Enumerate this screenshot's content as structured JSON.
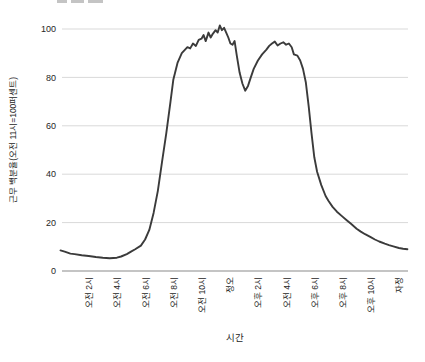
{
  "page": {
    "background": "#ffffff"
  },
  "chart_data": {
    "type": "line",
    "title": "",
    "xlabel": "시간",
    "ylabel": "근무 백분율(오전 11시=100퍼센트)",
    "x_tick_labels": [
      "오전 2시",
      "오전 4시",
      "오전 6시",
      "오전 8시",
      "오전 10시",
      "정오",
      "오후 2시",
      "오전 4시",
      "오후 6시",
      "오후 8시",
      "오후 10시",
      "자정"
    ],
    "x_tick_hours": [
      2,
      4,
      6,
      8,
      10,
      12,
      14,
      16,
      18,
      20,
      22,
      24
    ],
    "y_ticks": [
      0,
      20,
      40,
      60,
      80,
      100
    ],
    "xlim": [
      0,
      24.6
    ],
    "ylim": [
      0,
      102
    ],
    "grid": true,
    "legend": "none",
    "line_color": "#3b3b3b",
    "grid_color": "#d9d9d9",
    "axis_color": "#8a8a8a",
    "text_color": "#262626",
    "series": [
      {
        "name": "근무 백분율",
        "x": [
          0,
          0.3,
          0.7,
          1,
          1.5,
          2,
          2.5,
          3,
          3.5,
          4,
          4.3,
          4.7,
          5,
          5.3,
          5.7,
          6,
          6.3,
          6.6,
          6.9,
          7.2,
          7.5,
          7.8,
          8,
          8.3,
          8.6,
          9,
          9.2,
          9.4,
          9.6,
          9.8,
          10,
          10.15,
          10.3,
          10.5,
          10.65,
          10.8,
          11,
          11.15,
          11.3,
          11.45,
          11.6,
          11.75,
          11.9,
          12.05,
          12.2,
          12.35,
          12.5,
          12.7,
          12.9,
          13.1,
          13.3,
          13.5,
          13.7,
          14,
          14.3,
          14.6,
          14.8,
          15,
          15.2,
          15.4,
          15.6,
          15.8,
          16,
          16.2,
          16.4,
          16.55,
          16.8,
          17,
          17.2,
          17.4,
          17.6,
          17.8,
          18,
          18.2,
          18.5,
          18.8,
          19,
          19.3,
          19.6,
          20,
          20.3,
          20.6,
          21,
          21.3,
          21.6,
          22,
          22.3,
          22.6,
          23,
          23.3,
          23.6,
          24,
          24.3,
          24.6
        ],
        "y": [
          8.5,
          8,
          7.2,
          7,
          6.5,
          6.2,
          5.8,
          5.5,
          5.3,
          5.5,
          6,
          7,
          8,
          9,
          10.5,
          13,
          17,
          24,
          33,
          45,
          57,
          70,
          79,
          86,
          90,
          92.5,
          92,
          94,
          93,
          95.5,
          96,
          97.5,
          95,
          98.5,
          96.5,
          98,
          99.5,
          98.5,
          101.5,
          99.5,
          100.5,
          98.5,
          96.5,
          94,
          93.5,
          95,
          89,
          82,
          77.5,
          74.5,
          76.5,
          80,
          83.5,
          87,
          89.5,
          91.5,
          93,
          94,
          94.8,
          93.2,
          94,
          94.5,
          93.5,
          94,
          92.5,
          89.5,
          89,
          87,
          83.5,
          78,
          68,
          57,
          47,
          41,
          35.5,
          31,
          29,
          26.5,
          24.5,
          22.5,
          21,
          19.5,
          17.5,
          16.3,
          15.2,
          14,
          13,
          12.2,
          11.3,
          10.7,
          10.2,
          9.5,
          9.2,
          9
        ]
      }
    ]
  }
}
